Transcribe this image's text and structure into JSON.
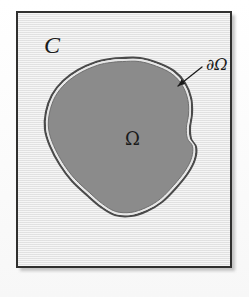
{
  "figure": {
    "type": "math-diagram",
    "outer_label": "C",
    "region_label": "Ω",
    "boundary_label": "∂Ω",
    "colors": {
      "page_background": "#fdfdfd",
      "plate_background": "#ebebeb",
      "plate_border": "#30302f",
      "region_fill": "#8b8b8b",
      "boundary_stroke": "#4a4a4a",
      "boundary_inner_gap": "#e6e6e6",
      "label_text": "#1b1b1b",
      "shadow": "#b9b9b9"
    },
    "plate": {
      "x": 16,
      "y": 11,
      "width": 216,
      "height": 257,
      "border_width": 2
    },
    "region_shape": {
      "kind": "closed-blob-polygon",
      "note": "approximate outline of the shaded region, in plate-local coordinates",
      "points": [
        [
          104,
          45
        ],
        [
          122,
          45
        ],
        [
          140,
          50
        ],
        [
          156,
          58
        ],
        [
          167,
          70
        ],
        [
          173,
          85
        ],
        [
          174,
          100
        ],
        [
          172,
          114
        ],
        [
          173,
          126
        ],
        [
          178,
          134
        ],
        [
          177,
          146
        ],
        [
          170,
          160
        ],
        [
          158,
          175
        ],
        [
          144,
          189
        ],
        [
          129,
          198
        ],
        [
          113,
          203
        ],
        [
          97,
          202
        ],
        [
          83,
          194
        ],
        [
          70,
          183
        ],
        [
          54,
          168
        ],
        [
          42,
          152
        ],
        [
          32,
          133
        ],
        [
          27,
          116
        ],
        [
          28,
          99
        ],
        [
          34,
          82
        ],
        [
          45,
          68
        ],
        [
          60,
          57
        ],
        [
          78,
          49
        ],
        [
          92,
          46
        ]
      ]
    },
    "annotation_arrow": {
      "from": [
        184,
        54
      ],
      "to": [
        160,
        73
      ],
      "head_length": 7
    },
    "label_positions": {
      "outer_label": [
        26,
        20
      ],
      "region_label": [
        107,
        117
      ],
      "boundary_label": [
        188,
        44
      ]
    }
  }
}
